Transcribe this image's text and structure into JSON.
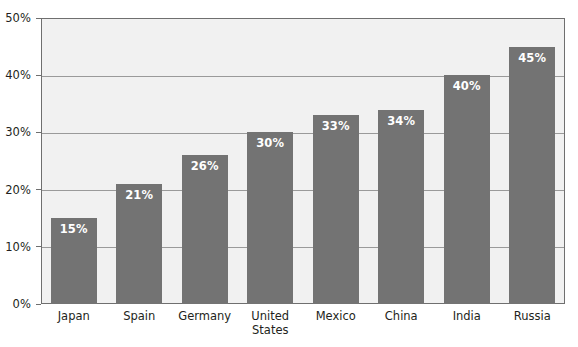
{
  "chart_data": {
    "type": "bar",
    "title": "",
    "subtitle": "",
    "xlabel": "",
    "ylabel": "",
    "categories": [
      "Japan",
      "Spain",
      "Germany",
      "United\nStates",
      "Mexico",
      "China",
      "India",
      "Russia"
    ],
    "values": [
      15,
      21,
      26,
      30,
      33,
      34,
      40,
      45
    ],
    "value_labels": [
      "15%",
      "21%",
      "26%",
      "30%",
      "33%",
      "34%",
      "40%",
      "45%"
    ],
    "ylim": [
      0,
      50
    ],
    "y_ticks": [
      0,
      10,
      20,
      30,
      40,
      50
    ],
    "y_tick_labels": [
      "0%",
      "10%",
      "20%",
      "30%",
      "40%",
      "50%"
    ],
    "grid": true,
    "grid_axis": "y",
    "legend": "none",
    "series": [
      {
        "name": "",
        "values": [
          15,
          21,
          26,
          30,
          33,
          34,
          40,
          45
        ]
      }
    ],
    "colors": {
      "bar": "#737373",
      "plot_background": "#f1f1f1",
      "figure_background": "#ffffff",
      "gridline": "#9a9a9a",
      "axis_line": "#6f6f6f",
      "axis_text": "#231f20",
      "value_label_text": "#ffffff"
    }
  }
}
